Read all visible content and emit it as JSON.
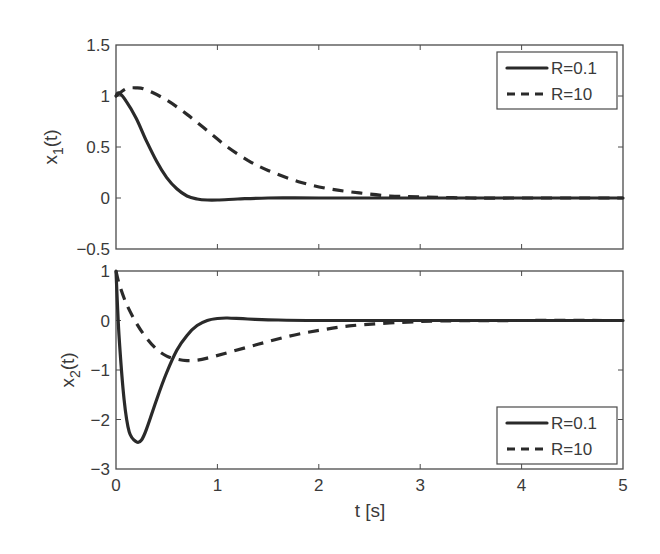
{
  "chart_data": [
    {
      "type": "line",
      "title": "",
      "xlabel": "",
      "ylabel": "x_1(t)",
      "xlim": [
        0,
        5
      ],
      "ylim": [
        -0.5,
        1.5
      ],
      "xticks": [
        "0",
        "1",
        "2",
        "3",
        "4",
        "5"
      ],
      "xticks_shown": false,
      "yticks": [
        "-0.5",
        "0",
        "0.5",
        "1",
        "1.5"
      ],
      "grid": false,
      "legend_position": "upper right",
      "series": [
        {
          "name": "R=0.1",
          "style": "solid",
          "x": [
            0,
            0.03,
            0.1,
            0.2,
            0.3,
            0.4,
            0.5,
            0.6,
            0.7,
            0.8,
            0.9,
            1.0,
            1.2,
            1.5,
            2.0,
            3.0,
            4.0,
            5.0
          ],
          "values": [
            1.0,
            1.03,
            0.95,
            0.78,
            0.56,
            0.36,
            0.2,
            0.09,
            0.02,
            -0.01,
            -0.02,
            -0.02,
            -0.01,
            0.0,
            0.0,
            0.0,
            0.0,
            0.0
          ]
        },
        {
          "name": "R=10",
          "style": "dashed",
          "x": [
            0,
            0.1,
            0.2,
            0.3,
            0.5,
            0.7,
            0.9,
            1.1,
            1.3,
            1.5,
            1.8,
            2.1,
            2.4,
            2.7,
            3.0,
            3.5,
            4.0,
            5.0
          ],
          "values": [
            1.0,
            1.07,
            1.08,
            1.06,
            0.96,
            0.82,
            0.66,
            0.5,
            0.37,
            0.27,
            0.16,
            0.09,
            0.05,
            0.02,
            0.01,
            0.0,
            0.0,
            0.0
          ]
        }
      ]
    },
    {
      "type": "line",
      "title": "",
      "xlabel": "t [s]",
      "ylabel": "x_2(t)",
      "xlim": [
        0,
        5
      ],
      "ylim": [
        -3,
        1
      ],
      "xticks": [
        "0",
        "1",
        "2",
        "3",
        "4",
        "5"
      ],
      "yticks": [
        "-3",
        "-2",
        "-1",
        "0",
        "1"
      ],
      "grid": false,
      "legend_position": "lower right",
      "series": [
        {
          "name": "R=0.1",
          "style": "solid",
          "x": [
            0,
            0.03,
            0.08,
            0.13,
            0.2,
            0.25,
            0.3,
            0.4,
            0.5,
            0.6,
            0.7,
            0.8,
            0.9,
            1.0,
            1.1,
            1.3,
            1.6,
            2.0,
            3.0,
            5.0
          ],
          "values": [
            1.0,
            -0.3,
            -1.6,
            -2.25,
            -2.45,
            -2.42,
            -2.2,
            -1.6,
            -1.05,
            -0.6,
            -0.3,
            -0.1,
            0.0,
            0.04,
            0.05,
            0.03,
            0.01,
            0.0,
            0.0,
            0.0
          ]
        },
        {
          "name": "R=10",
          "style": "dashed",
          "x": [
            0,
            0.03,
            0.1,
            0.2,
            0.3,
            0.4,
            0.5,
            0.6,
            0.7,
            0.8,
            0.9,
            1.1,
            1.4,
            1.7,
            2.0,
            2.3,
            2.7,
            3.2,
            4.0,
            5.0
          ],
          "values": [
            1.0,
            0.75,
            0.35,
            -0.05,
            -0.35,
            -0.58,
            -0.72,
            -0.78,
            -0.81,
            -0.8,
            -0.76,
            -0.65,
            -0.48,
            -0.32,
            -0.2,
            -0.11,
            -0.05,
            -0.01,
            0.0,
            0.0
          ]
        }
      ]
    }
  ],
  "figure": {
    "top_panel": {
      "ylabel_main": "x",
      "ylabel_sub": "1",
      "ylabel_tail": "(t)",
      "yticks": [
        {
          "label": "1.5",
          "value": 1.5
        },
        {
          "label": "1",
          "value": 1
        },
        {
          "label": "0.5",
          "value": 0.5
        },
        {
          "label": "0",
          "value": 0
        },
        {
          "label": "−0.5",
          "value": -0.5
        }
      ],
      "legend": [
        {
          "label": "R=0.1",
          "style": "solid"
        },
        {
          "label": "R=10",
          "style": "dashed"
        }
      ]
    },
    "bottom_panel": {
      "ylabel_main": "x",
      "ylabel_sub": "2",
      "ylabel_tail": "(t)",
      "yticks": [
        {
          "label": "1",
          "value": 1
        },
        {
          "label": "0",
          "value": 0
        },
        {
          "label": "−1",
          "value": -1
        },
        {
          "label": "−2",
          "value": -2
        },
        {
          "label": "−3",
          "value": -3
        }
      ],
      "legend": [
        {
          "label": "R=0.1",
          "style": "solid"
        },
        {
          "label": "R=10",
          "style": "dashed"
        }
      ]
    },
    "xticks": [
      "0",
      "1",
      "2",
      "3",
      "4",
      "5"
    ],
    "xlabel": "t [s]",
    "colors": {
      "line": "#2a2a2a",
      "axes": "#4a4a4a",
      "text": "#3a3a3a",
      "background": "#ffffff"
    }
  }
}
